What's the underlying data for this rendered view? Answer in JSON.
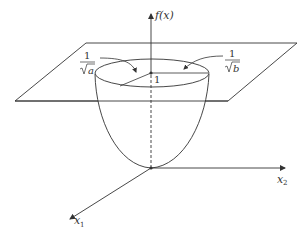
{
  "diagram": {
    "type": "3d-paraboloid-with-level-plane",
    "labels": {
      "f_axis": "f(x)",
      "x1_axis": "x",
      "x1_sub": "1",
      "x2_axis": "x",
      "x2_sub": "2",
      "one": "1",
      "frac_a_num": "1",
      "frac_a_den": "a",
      "frac_b_num": "1",
      "frac_b_den": "b"
    },
    "colors": {
      "stroke": "#333333",
      "background": "#ffffff"
    }
  }
}
